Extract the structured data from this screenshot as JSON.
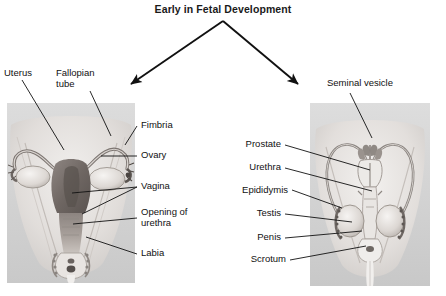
{
  "figure": {
    "title": "Early in Fetal Development",
    "arrow_count": 2,
    "line_color": "#111111",
    "text_color": "#111111",
    "panel_bg_color": "#d9d9d9"
  },
  "female_panel": {
    "name": "female-reproductive-anatomy",
    "labels": [
      {
        "id": "uterus",
        "text": "Uterus"
      },
      {
        "id": "fallopian-tube",
        "text": "Fallopian\ntube"
      },
      {
        "id": "fimbria",
        "text": "Fimbria"
      },
      {
        "id": "ovary",
        "text": "Ovary"
      },
      {
        "id": "vagina",
        "text": "Vagina"
      },
      {
        "id": "opening-of-urethra",
        "text": "Opening of\nurethra"
      },
      {
        "id": "labia",
        "text": "Labia"
      }
    ]
  },
  "male_panel": {
    "name": "male-reproductive-anatomy",
    "labels": [
      {
        "id": "seminal-vesicle",
        "text": "Seminal vesicle"
      },
      {
        "id": "prostate",
        "text": "Prostate"
      },
      {
        "id": "urethra",
        "text": "Urethra"
      },
      {
        "id": "epididymis",
        "text": "Epididymis"
      },
      {
        "id": "testis",
        "text": "Testis"
      },
      {
        "id": "penis",
        "text": "Penis"
      },
      {
        "id": "scrotum",
        "text": "Scrotum"
      }
    ]
  }
}
